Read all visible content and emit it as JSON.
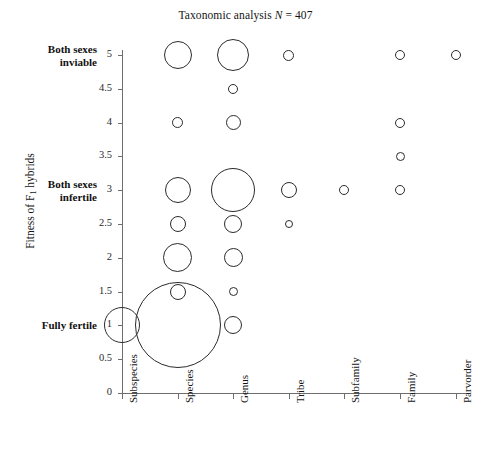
{
  "chart_data": {
    "type": "scatter",
    "title": "Taxonomic analysis N = 407",
    "title_prefix": "Taxonomic analysis ",
    "title_stat": "N",
    "title_value": " = 407",
    "n": 407,
    "xlabel": "",
    "ylabel": "Fitness of F1 hybrids",
    "ylabel_main": "Fitness of F",
    "ylabel_sub": "1",
    "ylabel_tail": " hybrids",
    "categories": [
      "Subspecies",
      "Species",
      "Genus",
      "Tribe",
      "Subfamily",
      "Family",
      "Parvorder"
    ],
    "ylim": [
      0,
      5
    ],
    "ytick_values": [
      0,
      0.5,
      1,
      1.5,
      2,
      2.5,
      3,
      3.5,
      4,
      4.5,
      5
    ],
    "ytick_labels": [
      "0",
      "0.5",
      "1",
      "1.5",
      "2",
      "2.5",
      "3",
      "3.5",
      "4",
      "4.5",
      "5"
    ],
    "y_state_labels": [
      {
        "value": 5,
        "line1": "Both sexes",
        "line2": "inviable"
      },
      {
        "value": 3,
        "line1": "Both sexes",
        "line2": "infertile"
      },
      {
        "value": 1,
        "line1": "Fully fertile",
        "line2": ""
      }
    ],
    "grid": false,
    "legend": "none",
    "marker_style": "open-circle",
    "size_encoding": "bubble area proportional to count",
    "points": [
      {
        "x": "Subspecies",
        "y": 1,
        "r": 18
      },
      {
        "x": "Species",
        "y": 5,
        "r": 14
      },
      {
        "x": "Species",
        "y": 4,
        "r": 5.5
      },
      {
        "x": "Species",
        "y": 3,
        "r": 13
      },
      {
        "x": "Species",
        "y": 2.5,
        "r": 8
      },
      {
        "x": "Species",
        "y": 2,
        "r": 14.5
      },
      {
        "x": "Species",
        "y": 1.5,
        "r": 8
      },
      {
        "x": "Species",
        "y": 1,
        "r": 43
      },
      {
        "x": "Genus",
        "y": 5,
        "r": 16
      },
      {
        "x": "Genus",
        "y": 4.5,
        "r": 5
      },
      {
        "x": "Genus",
        "y": 4,
        "r": 7.5
      },
      {
        "x": "Genus",
        "y": 3,
        "r": 22
      },
      {
        "x": "Genus",
        "y": 2.5,
        "r": 9
      },
      {
        "x": "Genus",
        "y": 2,
        "r": 9.5
      },
      {
        "x": "Genus",
        "y": 1.5,
        "r": 4.5
      },
      {
        "x": "Genus",
        "y": 1,
        "r": 9
      },
      {
        "x": "Tribe",
        "y": 5,
        "r": 5.5
      },
      {
        "x": "Tribe",
        "y": 3,
        "r": 8
      },
      {
        "x": "Tribe",
        "y": 2.5,
        "r": 4
      },
      {
        "x": "Subfamily",
        "y": 3,
        "r": 5
      },
      {
        "x": "Family",
        "y": 5,
        "r": 5
      },
      {
        "x": "Family",
        "y": 4,
        "r": 5
      },
      {
        "x": "Family",
        "y": 3.5,
        "r": 4.5
      },
      {
        "x": "Family",
        "y": 3,
        "r": 5
      },
      {
        "x": "Parvorder",
        "y": 5,
        "r": 5
      }
    ],
    "colors": {
      "marker_stroke": "#2b2b2b",
      "axis": "#6e6e6e",
      "text": "#141414",
      "background": "#ffffff"
    }
  }
}
